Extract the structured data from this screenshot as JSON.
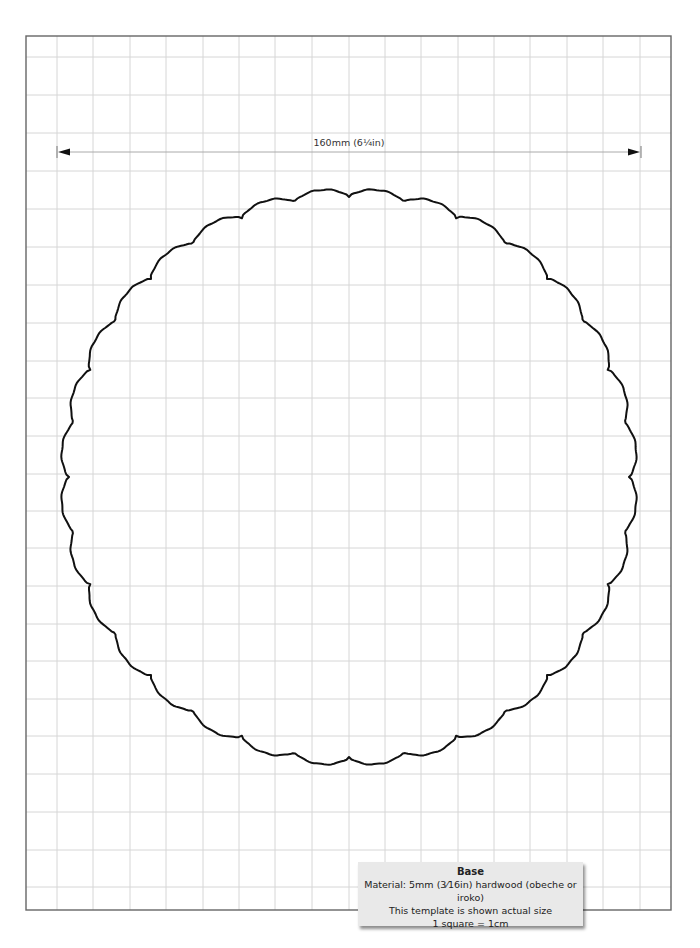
{
  "template": {
    "dimension_label": "160mm (6¼in)",
    "info": {
      "title": "Base",
      "material": "Material:  5mm (3⁄16in) hardwood (obeche or iroko)",
      "note": "This template is shown actual size",
      "scale": "1 square = 1cm"
    }
  },
  "layout": {
    "frame": {
      "x": 26,
      "y": 36,
      "w": 645,
      "h": 874,
      "stroke": "#666666"
    },
    "grid": {
      "stroke": "#d6d6d6",
      "v_lines": [
        57,
        93,
        130,
        166,
        203,
        239,
        275,
        312,
        349,
        385,
        421,
        458,
        494,
        530,
        567,
        603,
        640
      ],
      "h_lines": [
        57,
        95,
        133,
        171,
        209,
        247,
        285,
        323,
        361,
        398,
        436,
        474,
        511,
        548,
        586,
        624,
        661,
        699,
        736,
        774,
        812,
        850,
        887
      ]
    },
    "dimension_line": {
      "x1": 57,
      "x2": 641,
      "y": 152,
      "color": "#aaaaaa",
      "arrow_color": "#111111"
    },
    "shape": {
      "cx": 349,
      "cy": 477,
      "r": 284,
      "bumps": 32,
      "amp": 9,
      "stroke": "#111111",
      "stroke_width": 2
    }
  }
}
